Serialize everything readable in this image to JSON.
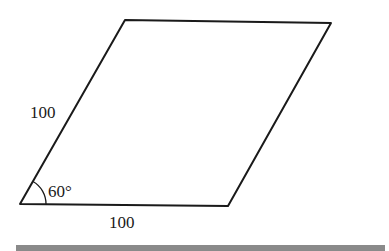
{
  "diagram": {
    "shape": "rhombus",
    "vertices": {
      "bottom_left": [
        20,
        204
      ],
      "bottom_right": [
        228,
        206
      ],
      "top_right": [
        331,
        23
      ],
      "top_left": [
        125,
        20
      ]
    },
    "labels": {
      "left_side": "100",
      "bottom_side": "100",
      "angle": "60°"
    },
    "colors": {
      "stroke": "#1a1a1a",
      "bar": "#8a8a8a"
    }
  }
}
